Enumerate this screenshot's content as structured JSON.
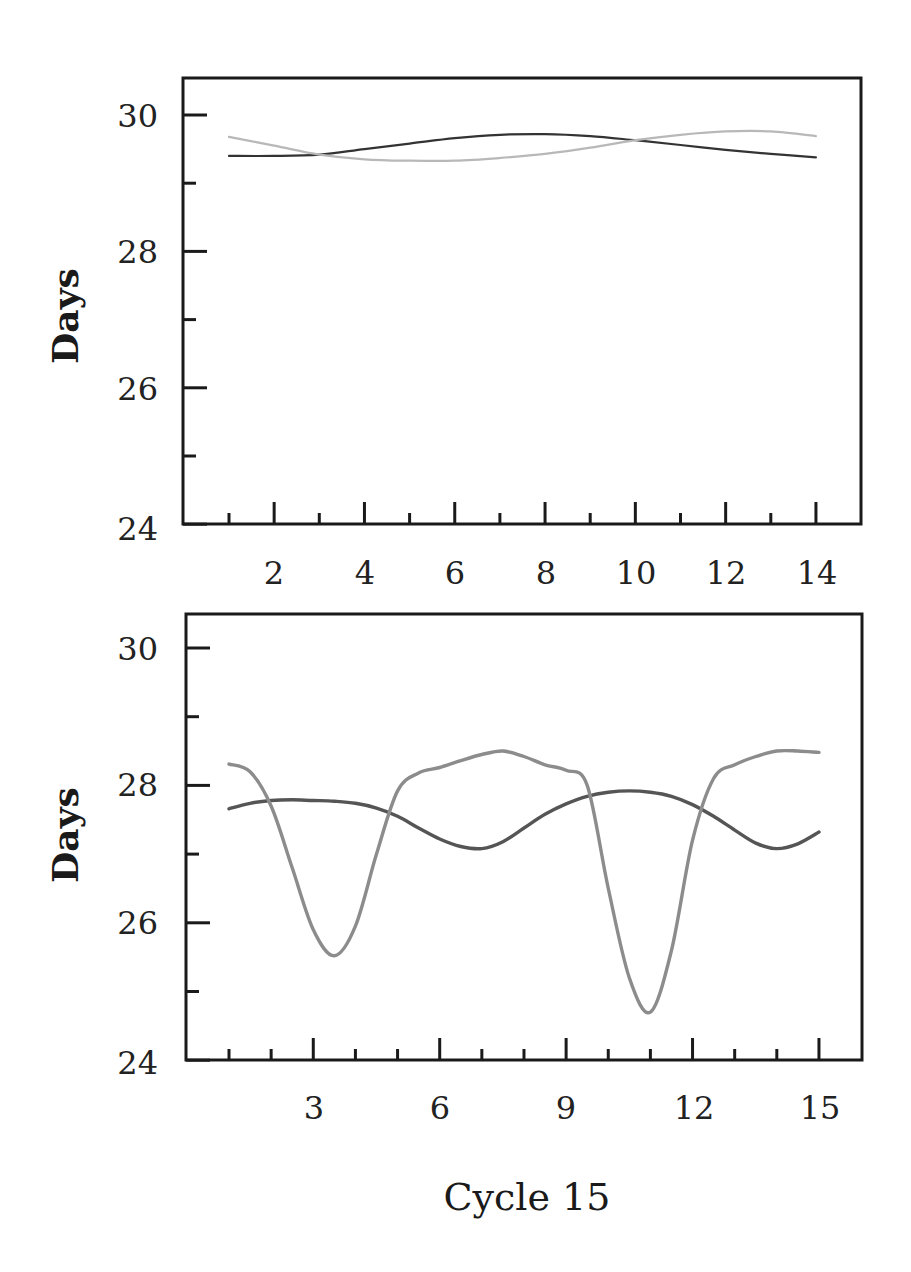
{
  "chart_data": [
    {
      "type": "line",
      "title": "",
      "xlabel": "",
      "ylabel": "Days",
      "xlim": [
        0,
        15
      ],
      "ylim": [
        24,
        30.6
      ],
      "xticks": [
        2,
        4,
        6,
        8,
        10,
        12,
        14
      ],
      "xticks_minor": [
        1,
        3,
        5,
        7,
        9,
        11,
        13
      ],
      "yticks": [
        24,
        26,
        28,
        30
      ],
      "yticks_minor": [
        25,
        27,
        29
      ],
      "grid": false,
      "legend": null,
      "x": [
        1,
        2,
        3,
        4,
        5,
        6,
        7,
        8,
        9,
        10,
        11,
        12,
        13,
        14
      ],
      "series": [
        {
          "name": "dark",
          "color": "#333333",
          "values": [
            29.4,
            29.4,
            29.42,
            29.5,
            29.58,
            29.66,
            29.71,
            29.72,
            29.69,
            29.63,
            29.56,
            29.49,
            29.43,
            29.38
          ]
        },
        {
          "name": "light",
          "color": "#b8b8b8",
          "values": [
            29.68,
            29.55,
            29.42,
            29.35,
            29.33,
            29.33,
            29.37,
            29.43,
            29.52,
            29.63,
            29.71,
            29.76,
            29.76,
            29.69
          ]
        }
      ]
    },
    {
      "type": "line",
      "title": "",
      "xlabel": "Cycle 15",
      "ylabel": "Days",
      "xlim": [
        0,
        16
      ],
      "ylim": [
        24,
        30.5
      ],
      "xticks": [
        3,
        6,
        9,
        12,
        15
      ],
      "xticks_minor": [
        1,
        2,
        4,
        5,
        7,
        8,
        10,
        11,
        13,
        14
      ],
      "yticks": [
        24,
        26,
        28,
        30
      ],
      "yticks_minor": [
        25,
        27,
        29
      ],
      "grid": false,
      "legend": null,
      "x": [
        1,
        1.5,
        2,
        2.5,
        3,
        3.5,
        4,
        4.5,
        5,
        5.5,
        6,
        6.5,
        7,
        7.5,
        8,
        8.5,
        9,
        9.5,
        10,
        10.5,
        11,
        11.5,
        12,
        12.5,
        13,
        13.5,
        14,
        14.5,
        15
      ],
      "series": [
        {
          "name": "dark",
          "color": "#555555",
          "values": [
            27.66,
            27.74,
            27.78,
            27.79,
            27.78,
            27.77,
            27.74,
            27.67,
            27.55,
            27.38,
            27.22,
            27.11,
            27.08,
            27.18,
            27.38,
            27.58,
            27.73,
            27.84,
            27.9,
            27.92,
            27.9,
            27.84,
            27.72,
            27.55,
            27.35,
            27.16,
            27.08,
            27.15,
            27.32
          ]
        },
        {
          "name": "light",
          "color": "#8c8c8c",
          "values": [
            28.31,
            28.2,
            27.7,
            26.8,
            25.9,
            25.52,
            25.95,
            27.0,
            27.92,
            28.18,
            28.26,
            28.36,
            28.45,
            28.5,
            28.42,
            28.3,
            28.22,
            28.0,
            26.5,
            25.2,
            24.7,
            25.6,
            27.2,
            28.1,
            28.3,
            28.42,
            28.5,
            28.5,
            28.48
          ]
        }
      ]
    }
  ],
  "panels": {
    "top": {
      "ylabel": "Days",
      "ytick_labels": [
        "30",
        "28",
        "26",
        "24"
      ],
      "xtick_labels": [
        "2",
        "4",
        "6",
        "8",
        "10",
        "12",
        "14"
      ]
    },
    "bottom": {
      "ylabel": "Days",
      "ytick_labels": [
        "30",
        "28",
        "26",
        "24"
      ],
      "xtick_labels": [
        "3",
        "6",
        "9",
        "12",
        "15"
      ],
      "xlabel": "Cycle 15"
    }
  }
}
